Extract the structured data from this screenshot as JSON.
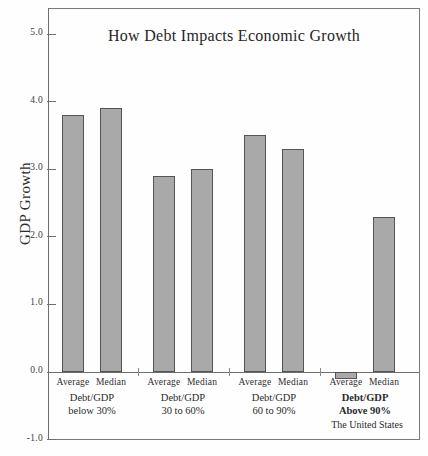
{
  "chart_data": {
    "type": "bar",
    "title": "How Debt Impacts Economic Growth",
    "xlabel": "",
    "ylabel": "GDP Growth",
    "ylim": [
      -1.0,
      5.0
    ],
    "ytick_labels": [
      "5.0",
      "4.0",
      "3.0",
      "2.0",
      "1.0",
      "0.0",
      "-1.0"
    ],
    "ytick_values": [
      5.0,
      4.0,
      3.0,
      2.0,
      1.0,
      0.0,
      -1.0
    ],
    "grid": false,
    "legend": "none",
    "series": [
      {
        "name": "Average",
        "values": [
          3.8,
          2.9,
          3.5,
          -0.1
        ]
      },
      {
        "name": "Median",
        "values": [
          3.9,
          3.0,
          3.3,
          2.3
        ]
      }
    ],
    "categories": [
      "Debt/GDP below 30%",
      "Debt/GDP 30 to 60%",
      "Debt/GDP 60 to 90%",
      "Debt/GDP Above 90%"
    ],
    "groups": [
      {
        "line1": "Debt/GDP",
        "line2": "below 30%",
        "note": "",
        "emphasis": false,
        "bars": [
          {
            "label": "Average",
            "value": 3.8
          },
          {
            "label": "Median",
            "value": 3.9
          }
        ]
      },
      {
        "line1": "Debt/GDP",
        "line2": "30 to 60%",
        "note": "",
        "emphasis": false,
        "bars": [
          {
            "label": "Average",
            "value": 2.9
          },
          {
            "label": "Median",
            "value": 3.0
          }
        ]
      },
      {
        "line1": "Debt/GDP",
        "line2": "60 to 90%",
        "note": "",
        "emphasis": false,
        "bars": [
          {
            "label": "Average",
            "value": 3.5
          },
          {
            "label": "Median",
            "value": 3.3
          }
        ]
      },
      {
        "line1": "Debt/GDP",
        "line2": "Above 90%",
        "note": "The United States",
        "emphasis": true,
        "bars": [
          {
            "label": "Average",
            "value": -0.1
          },
          {
            "label": "Median",
            "value": 2.3
          }
        ]
      }
    ],
    "colors": {
      "bar_fill": "#a9a9a9",
      "bar_stroke": "#555555",
      "axis": "#6e6e6e",
      "text": "#2b2b2b",
      "background": "#ffffff"
    }
  }
}
